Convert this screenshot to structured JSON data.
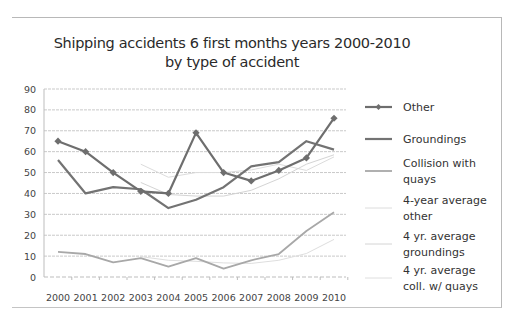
{
  "chart_data": {
    "type": "line",
    "title": "Shipping accidents 6 first months years 2000-2010",
    "subtitle": "by type of accident",
    "xlabel": "",
    "ylabel": "",
    "ylim": [
      0,
      90
    ],
    "yticks": [
      0,
      10,
      20,
      30,
      40,
      50,
      60,
      70,
      80,
      90
    ],
    "grid": true,
    "legend_position": "right",
    "categories": [
      "2000",
      "2001",
      "2002",
      "2003",
      "2004",
      "2005",
      "2006",
      "2007",
      "2008",
      "2009",
      "2010"
    ],
    "series": [
      {
        "name": "Other",
        "values": [
          65,
          60,
          50,
          41,
          40,
          69,
          50,
          46,
          51,
          57,
          76
        ],
        "color": "#6e6e6e",
        "marker": "diamond",
        "width": 2.2
      },
      {
        "name": "Groundings",
        "values": [
          56,
          40,
          43,
          42,
          33,
          37,
          43,
          53,
          55,
          65,
          61
        ],
        "color": "#737373",
        "marker": "none",
        "width": 2.2
      },
      {
        "name": "Collision with quays",
        "values": [
          12,
          11,
          7,
          9,
          5,
          9,
          4,
          8,
          11,
          22,
          31
        ],
        "color": "#a8a8a8",
        "marker": "none",
        "width": 1.8
      },
      {
        "name": "4-year average other",
        "values": [
          null,
          null,
          null,
          54,
          47.75,
          50,
          50,
          51.25,
          54,
          51,
          57.5
        ],
        "color": "#dcdcdc",
        "marker": "none",
        "width": 1
      },
      {
        "name": "4 yr. average groundings",
        "values": [
          null,
          null,
          null,
          45.25,
          39.5,
          38.75,
          38.75,
          41.5,
          47,
          54,
          58.5
        ],
        "color": "#d4d4d4",
        "marker": "none",
        "width": 1
      },
      {
        "name": "4 yr. average coll. w/ quays",
        "values": [
          null,
          null,
          null,
          9.75,
          8,
          7.5,
          6.75,
          6.5,
          8,
          11.25,
          18
        ],
        "color": "#dedede",
        "marker": "none",
        "width": 1
      }
    ]
  },
  "legend": [
    {
      "lines": [
        "Other"
      ]
    },
    {
      "lines": [
        "Groundings"
      ]
    },
    {
      "lines": [
        "Collision with",
        "quays"
      ]
    },
    {
      "lines": [
        "4-year average",
        "other"
      ]
    },
    {
      "lines": [
        "4 yr. average",
        "groundings"
      ]
    },
    {
      "lines": [
        "4 yr. average",
        "coll. w/ quays"
      ]
    }
  ]
}
